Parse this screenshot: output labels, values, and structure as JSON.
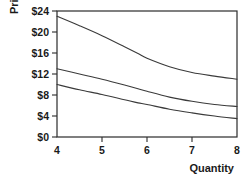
{
  "chart_data": {
    "type": "line",
    "title": "",
    "xlabel": "Quantity",
    "ylabel": "Price",
    "xlim": [
      4,
      8
    ],
    "ylim": [
      0,
      24
    ],
    "grid": false,
    "legend": "none",
    "xticks": [
      "4",
      "5",
      "6",
      "7",
      "8"
    ],
    "xtick_values": [
      4,
      5,
      6,
      7,
      8
    ],
    "yticks": [
      "$0",
      "$4",
      "$8",
      "$12",
      "$16",
      "$20",
      "$24"
    ],
    "ytick_values": [
      0,
      4,
      8,
      12,
      16,
      20,
      24
    ],
    "x": [
      4,
      4.5,
      5,
      5.5,
      5.8,
      6,
      6.5,
      7,
      7.5,
      8
    ],
    "series": [
      {
        "name": "top-curve",
        "color": "#3a3a3a",
        "values": [
          23.0,
          21.2,
          19.3,
          17.2,
          15.9,
          15.0,
          13.4,
          12.3,
          11.6,
          11.0
        ]
      },
      {
        "name": "middle-curve",
        "color": "#3a3a3a",
        "values": [
          13.0,
          12.0,
          11.0,
          9.9,
          9.2,
          8.7,
          7.6,
          6.8,
          6.2,
          5.8
        ]
      },
      {
        "name": "bottom-curve",
        "color": "#3a3a3a",
        "values": [
          10.0,
          9.0,
          8.1,
          7.1,
          6.5,
          6.2,
          5.3,
          4.6,
          4.0,
          3.5
        ]
      }
    ]
  },
  "axes": {
    "ylabel_text": "Price",
    "xlabel_text": "Quantity"
  }
}
